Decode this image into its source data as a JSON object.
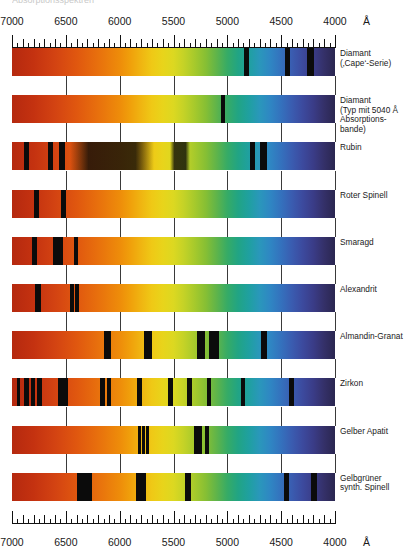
{
  "figure": {
    "cropped_header_text": "Absorptionsspektren",
    "unit_symbol": "Å",
    "axis_tick_labels": [
      "7000",
      "6500",
      "6000",
      "5500",
      "5000",
      "4500",
      "4000"
    ]
  },
  "chart_data": {
    "type": "heatmap",
    "xlabel": "Wellenlänge (Å)",
    "ylabel": "",
    "xlim": [
      7000,
      4000
    ],
    "x_axis_inverted": true,
    "xticks": [
      7000,
      6500,
      6000,
      5500,
      5000,
      4500,
      4000
    ],
    "xtick_labels": [
      "7000",
      "6500",
      "6000",
      "5500",
      "5000",
      "4500",
      "4000"
    ],
    "grid": true,
    "legend": "none",
    "categories": [
      "Diamant (‚Cape‘-Serie)",
      "Diamant (Typ mit 5040 Å Absorptionsbande)",
      "Rubin",
      "Roter Spinell",
      "Smaragd",
      "Alexandrit",
      "Almandin-Granat",
      "Zirkon",
      "Gelber Apatit",
      "Gelbgrüner synth. Spinell"
    ],
    "series": [
      {
        "name": "Diamant (‚Cape‘-Serie)",
        "label": "Diamant\n(‚Cape‘-Serie)",
        "absorption_lines_angstrom": [
          4780,
          4420,
          4150
        ],
        "absorption_lines_pct": [
          72.5,
          85.2,
          92.3
        ],
        "line_widths_pct": [
          1.5,
          1.5,
          2.2
        ]
      },
      {
        "name": "Diamant (Typ mit 5040 Å Absorptionsbande)",
        "label": "Diamant\n(Typ mit 5040 Å\nAbsorptions-\nbande)",
        "absorption_lines_angstrom": [
          5040
        ],
        "absorption_lines_pct": [
          65.3
        ],
        "line_widths_pct": [
          1.2
        ]
      },
      {
        "name": "Rubin",
        "label": "Rubin",
        "absorption_lines_angstrom": [
          6940,
          6680,
          6600,
          6100,
          5500,
          4760,
          4680
        ],
        "absorption_lines_pct": [
          4.5,
          12.0,
          15.5,
          31.0,
          52.0,
          74.5,
          78.0
        ],
        "line_widths_pct": [
          1.6,
          1.4,
          1.6,
          26.0,
          6.0,
          1.4,
          2.2
        ]
      },
      {
        "name": "Roter Spinell",
        "label": "Roter Spinell",
        "absorption_lines_angstrom": [
          6840,
          6580
        ],
        "absorption_lines_pct": [
          7.5,
          16.0
        ],
        "line_widths_pct": [
          1.6,
          1.6
        ]
      },
      {
        "name": "Smaragd",
        "label": "Smaragd",
        "absorption_lines_angstrom": [
          6830,
          6630,
          6600,
          6440
        ],
        "absorption_lines_pct": [
          7.0,
          13.5,
          15.0,
          19.8
        ],
        "line_widths_pct": [
          1.6,
          1.6,
          1.5,
          1.4
        ]
      },
      {
        "name": "Alexandrit",
        "label": "Alexandrit",
        "absorption_lines_angstrom": [
          6800,
          6480,
          6430
        ],
        "absorption_lines_pct": [
          8.0,
          18.5,
          20.2
        ],
        "line_widths_pct": [
          2.0,
          1.3,
          1.3
        ]
      },
      {
        "name": "Almandin-Granat",
        "label": "Almandin-Granat",
        "absorption_lines_angstrom": [
          6160,
          5800,
          5270,
          5180,
          4800
        ],
        "absorption_lines_pct": [
          29.5,
          42.0,
          58.5,
          62.5,
          78.0
        ],
        "line_widths_pct": [
          2.0,
          2.5,
          2.6,
          3.0,
          1.6
        ]
      },
      {
        "name": "Zirkon",
        "label": "Zirkon",
        "absorption_lines_angstrom": [
          6910,
          6830,
          6760,
          6720,
          6490,
          6450,
          6050,
          5990,
          5680,
          5370,
          5170,
          5000,
          4700,
          4200
        ],
        "absorption_lines_pct": [
          2.0,
          4.5,
          6.5,
          8.5,
          15.0,
          16.5,
          28.0,
          30.0,
          39.5,
          49.0,
          55.0,
          61.0,
          71.5,
          86.5
        ],
        "line_widths_pct": [
          1.2,
          1.6,
          1.2,
          1.5,
          1.4,
          1.4,
          1.4,
          1.2,
          1.4,
          1.4,
          1.4,
          1.4,
          1.4,
          1.4
        ]
      },
      {
        "name": "Gelber Apatit",
        "label": "Gelber Apatit",
        "absorption_lines_angstrom": [
          5800,
          5770,
          5750,
          5300,
          5270,
          5200
        ],
        "absorption_lines_pct": [
          39.5,
          40.8,
          42.0,
          57.0,
          58.2,
          60.5
        ],
        "line_widths_pct": [
          1.0,
          1.0,
          1.0,
          1.0,
          1.0,
          1.2
        ]
      },
      {
        "name": "Gelbgrüner synth. Spinell",
        "label": "Gelbgrüner\nsynth. Spinell",
        "absorption_lines_angstrom": [
          6350,
          5870,
          5530,
          4560,
          4360
        ],
        "absorption_lines_pct": [
          22.5,
          40.0,
          54.5,
          85.0,
          93.5
        ],
        "line_widths_pct": [
          4.5,
          3.2,
          2.0,
          1.8,
          1.8
        ]
      }
    ]
  }
}
